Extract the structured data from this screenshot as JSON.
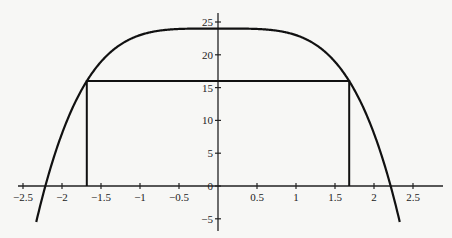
{
  "chart_data": {
    "type": "line",
    "title": "",
    "xlabel": "",
    "ylabel": "",
    "function": "y = 24 - x^4",
    "xlim": [
      -2.65,
      2.85
    ],
    "ylim": [
      -6.7,
      26.0
    ],
    "grid": false,
    "legend": null,
    "x_ticks": [
      -2.5,
      -2,
      -1.5,
      -1,
      -0.5,
      0.5,
      1,
      1.5,
      2,
      2.5
    ],
    "x_tick_labels": [
      "-2.5",
      "-2",
      "-1.5",
      "-1",
      "-0.5",
      "0.5",
      "1",
      "1.5",
      "2",
      "2.5"
    ],
    "y_ticks": [
      -5,
      0,
      5,
      10,
      15,
      20,
      25
    ],
    "y_tick_labels": [
      "-5",
      "0",
      "5",
      "10",
      "15",
      "20",
      "25"
    ],
    "series": [
      {
        "name": "curve",
        "x": [
          -2.33,
          -2.2,
          -2.0,
          -1.8,
          -1.6,
          -1.4,
          -1.2,
          -1.0,
          -0.8,
          -0.6,
          -0.4,
          -0.2,
          0,
          0.2,
          0.4,
          0.6,
          0.8,
          1.0,
          1.2,
          1.4,
          1.6,
          1.8,
          2.0,
          2.2,
          2.33
        ],
        "y": [
          -5.47,
          0.57,
          8.0,
          13.5,
          17.45,
          20.16,
          21.93,
          23.0,
          23.59,
          23.87,
          23.97,
          24.0,
          24.0,
          24.0,
          23.97,
          23.87,
          23.59,
          23.0,
          21.93,
          20.16,
          17.45,
          13.5,
          8.0,
          0.57,
          -5.47
        ]
      }
    ],
    "annotations": [
      {
        "type": "rectangle",
        "x": [
          -1.682,
          1.682
        ],
        "y": [
          0,
          16
        ],
        "description": "inscribed rectangle with top corners on the curve"
      }
    ]
  }
}
